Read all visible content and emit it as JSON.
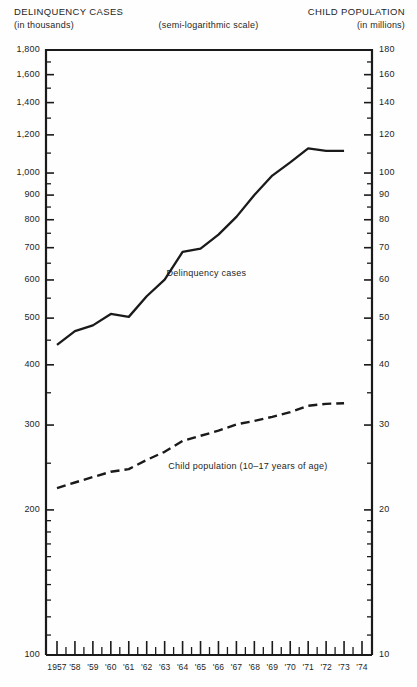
{
  "header": {
    "left_title": "DELINQUENCY CASES",
    "left_sub": "(in thousands)",
    "center_note": "(semi-logarithmic scale)",
    "right_title": "CHILD POPULATION",
    "right_sub": "(in millions)"
  },
  "chart_data": {
    "type": "line",
    "title": "",
    "subtitle": "(semi-logarithmic scale)",
    "xlabel": "",
    "ylabel": "DELINQUENCY CASES (in thousands)",
    "y2label": "CHILD POPULATION (in millions)",
    "scale": "semi-logarithmic",
    "grid": false,
    "legend_position": "inline-annotation",
    "xlim": [
      1957,
      1974.5
    ],
    "ylim": [
      100,
      1800
    ],
    "y2lim": [
      10,
      180
    ],
    "yticks": [
      100,
      200,
      300,
      400,
      500,
      600,
      700,
      800,
      900,
      1000,
      1200,
      1400,
      1600,
      1800
    ],
    "ytick_labels": [
      "100",
      "200",
      "300",
      "400",
      "500",
      "600",
      "700",
      "800",
      "900",
      "1,000",
      "1,200",
      "1,400",
      "1,600",
      "1,800"
    ],
    "y2ticks": [
      10,
      20,
      30,
      40,
      50,
      60,
      70,
      80,
      90,
      100,
      120,
      140,
      160,
      180
    ],
    "y2tick_labels": [
      "10",
      "20",
      "30",
      "40",
      "50",
      "60",
      "70",
      "80",
      "90",
      "100",
      "120",
      "140",
      "160",
      "180"
    ],
    "y_minor_ticks": [
      110,
      120,
      130,
      140,
      150,
      160,
      170,
      180,
      190,
      250,
      350,
      450,
      550,
      650,
      750,
      850,
      950,
      1100,
      1300,
      1500,
      1700
    ],
    "x": [
      1957,
      1958,
      1959,
      1960,
      1961,
      1962,
      1963,
      1964,
      1965,
      1966,
      1967,
      1968,
      1969,
      1970,
      1971,
      1972,
      1973
    ],
    "xtick_labels": [
      "1957",
      "'58",
      "'59",
      "'60",
      "'61",
      "'62",
      "'63",
      "'64",
      "'65",
      "'66",
      "'67",
      "'68",
      "'69",
      "'70",
      "'71",
      "'72",
      "'73",
      "'74"
    ],
    "xtick_years": [
      1957,
      1958,
      1959,
      1960,
      1961,
      1962,
      1963,
      1964,
      1965,
      1966,
      1967,
      1968,
      1969,
      1970,
      1971,
      1972,
      1973,
      1974
    ],
    "series": [
      {
        "name": "Delinquency cases",
        "label": "Delinquency cases",
        "style": "solid",
        "axis": "left",
        "units": "thousands",
        "values": [
          440,
          470,
          483,
          510,
          503,
          555,
          601,
          686,
          697,
          745,
          811,
          900,
          988,
          1052,
          1125,
          1112,
          1112
        ]
      },
      {
        "name": "Child population (10-17 years of age)",
        "label": "Child population (10–17 years of age)",
        "style": "dashed",
        "axis": "right",
        "units": "millions",
        "values": [
          22.2,
          22.8,
          23.4,
          24.0,
          24.3,
          25.4,
          26.4,
          27.8,
          28.5,
          29.2,
          30.1,
          30.6,
          31.2,
          31.9,
          32.9,
          33.2,
          33.3
        ]
      }
    ],
    "annotations": [
      {
        "text": "Delinquency cases",
        "x": 1963.1,
        "y": 620
      },
      {
        "text": "Child population (10–17 years of age)",
        "x": 1963.2,
        "y": 247
      }
    ]
  }
}
